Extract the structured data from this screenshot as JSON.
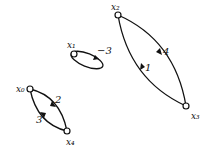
{
  "diagram": {
    "type": "weighted-digraph",
    "nodes": [
      {
        "id": "x0",
        "label": "x₀",
        "cx": 30,
        "cy": 89
      },
      {
        "id": "x1",
        "label": "x₁",
        "cx": 74,
        "cy": 54
      },
      {
        "id": "x2",
        "label": "x₂",
        "cx": 118,
        "cy": 15
      },
      {
        "id": "x3",
        "label": "x₃",
        "cx": 186,
        "cy": 106
      },
      {
        "id": "x4",
        "label": "x₄",
        "cx": 67,
        "cy": 131
      }
    ],
    "edges": [
      {
        "from": "x0",
        "to": "x4",
        "label": "2"
      },
      {
        "from": "x4",
        "to": "x0",
        "label": "3"
      },
      {
        "from": "x1",
        "to": "x1",
        "label": "−3"
      },
      {
        "from": "x2",
        "to": "x3",
        "label": "4"
      },
      {
        "from": "x3",
        "to": "x2",
        "label": "1"
      }
    ]
  }
}
